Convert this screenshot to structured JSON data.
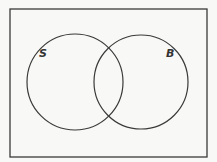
{
  "diagram": {
    "type": "venn",
    "universe": {
      "x": 10,
      "y": 9,
      "width": 197,
      "height": 148
    },
    "sets": [
      {
        "label": "S",
        "cx": 75,
        "cy": 82,
        "r": 48,
        "label_x": 41,
        "label_y": 57
      },
      {
        "label": "B",
        "cx": 141,
        "cy": 82,
        "r": 47,
        "label_x": 167,
        "label_y": 57
      }
    ],
    "colors": {
      "background": "#f8f8f6",
      "stroke": "#3a3a3a",
      "label": "#333333"
    }
  }
}
